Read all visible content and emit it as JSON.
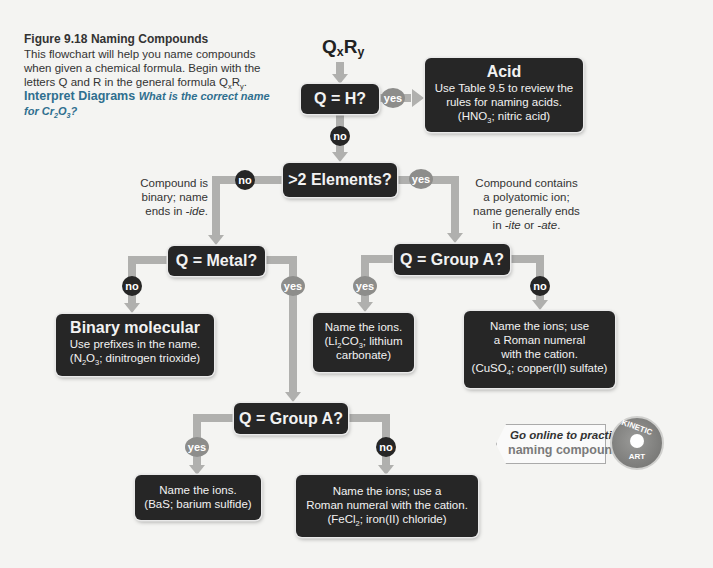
{
  "caption": {
    "figure_label": "Figure 9.18",
    "figure_title": "Naming Compounds",
    "description_pre": "This flowchart will help you name compounds when given a chemical formula. Begin with the letters Q and R in the general formula Q",
    "description_sub1": "x",
    "description_mid": "R",
    "description_sub2": "y",
    "description_post": ".",
    "interpret_label": "Interpret Diagrams",
    "question_pre": "What is the correct name for Cr",
    "question_sub1": "2",
    "question_mid": "O",
    "question_sub2": "3",
    "question_post": "?"
  },
  "start": {
    "q": "Q",
    "qsub": "x",
    "r": "R",
    "rsub": "y"
  },
  "nodes": {
    "q_h": "Q = H?",
    "more_elements": ">2 Elements?",
    "q_metal": "Q = Metal?",
    "q_groupA_poly": "Q = Group A?",
    "q_groupA_metal": "Q = Group A?"
  },
  "badges": {
    "yes": "yes",
    "no": "no"
  },
  "notes": {
    "binary": [
      "Compound is",
      "binary; name",
      "ends in ",
      "-ide",
      "."
    ],
    "poly": [
      "Compound contains",
      "a polyatomic ion;",
      "name generally ends",
      "in ",
      "-ite",
      " or ",
      "-ate",
      "."
    ]
  },
  "results": {
    "acid": {
      "title": "Acid",
      "line1": "Use Table 9.5 to review the",
      "line2": "rules for naming acids.",
      "ex_pre": "(HNO",
      "ex_sub": "3",
      "ex_post": "; nitric acid)"
    },
    "binary_molecular": {
      "title": "Binary molecular",
      "line1": "Use prefixes in the name.",
      "ex_a": "(N",
      "ex_sub1": "2",
      "ex_b": "O",
      "ex_sub2": "3",
      "ex_post": "; dinitrogen trioxide)"
    },
    "poly_groupA": {
      "line1": "Name the ions.",
      "ex_pre": "(Li",
      "ex_sub1": "2",
      "ex_mid": "CO",
      "ex_sub2": "3",
      "ex_post": "; lithium",
      "line3": "carbonate)"
    },
    "poly_not_groupA": {
      "line1": "Name the ions; use",
      "line2": "a Roman numeral",
      "line3": "with the cation.",
      "ex_pre": "(CuSO",
      "ex_sub": "4",
      "ex_post": "; copper(II) sulfate)"
    },
    "metal_groupA": {
      "line1": "Name the ions.",
      "line2": "(BaS; barium sulfide)"
    },
    "metal_not_groupA": {
      "line1": "Name the ions; use a",
      "line2": "Roman numeral with the cation.",
      "ex_pre": "(FeCl",
      "ex_sub": "2",
      "ex_post": "; iron(II) chloride)"
    }
  },
  "promo": {
    "line1": "Go online to practice",
    "line2": "naming compounds.",
    "badge_top": "KINETIC",
    "badge_bottom": "ART"
  },
  "colors": {
    "box": "#262626",
    "connector": "#b0b0ae",
    "yes_badge": "#8d8d8b",
    "no_badge": "#262626",
    "accent_blue": "#2f6f8f"
  }
}
